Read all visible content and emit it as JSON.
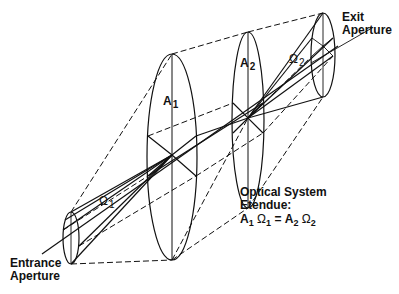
{
  "diagram": {
    "title": "Optical System Etendue",
    "labels": {
      "entrance": [
        "Entrance",
        "Aperture"
      ],
      "exit": [
        "Exit",
        "Aperture"
      ],
      "a1": {
        "base": "A",
        "sub": "1"
      },
      "a2": {
        "base": "A",
        "sub": "2"
      },
      "omega1": {
        "base": "Ω",
        "sub": "1"
      },
      "omega2": {
        "base": "Ω",
        "sub": "2"
      },
      "caption": {
        "line1": "Optical System",
        "line2": "Etendue:",
        "equation": {
          "a1": "A",
          "a1_sub": "1",
          "o1": "Ω",
          "o1_sub": "1",
          "eq": "=",
          "a2": "A",
          "a2_sub": "2",
          "o2": "Ω",
          "o2_sub": "2"
        }
      }
    },
    "colors": {
      "line": "#111111",
      "background": "#ffffff"
    }
  }
}
